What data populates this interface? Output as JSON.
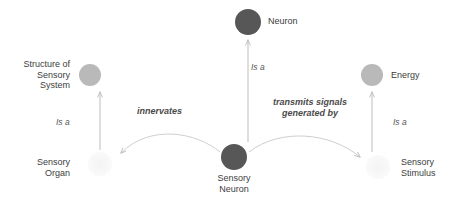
{
  "diagram": {
    "background_color": "#ffffff",
    "colors": {
      "node_dark": "#575757",
      "node_light": "#b9b9b9",
      "node_faint": "#f4f4f4",
      "edge_line": "#bdbdbd",
      "label_text": "#3d3d3d",
      "edge_label_text": "#4a4a4a"
    },
    "nodes": [
      {
        "id": "neuron",
        "label": "Neuron",
        "shade": "dark",
        "cx": 248,
        "cy": 22,
        "r": 13,
        "label_x": 268,
        "label_y": 16,
        "label_align": "left"
      },
      {
        "id": "structure-of-sensory-system",
        "label": "Structure of\nSensory\nSystem",
        "shade": "light",
        "cx": 90,
        "cy": 75,
        "r": 11,
        "label_x": 8,
        "label_y": 60,
        "label_align": "right"
      },
      {
        "id": "energy",
        "label": "Energy",
        "shade": "light",
        "cx": 372,
        "cy": 75,
        "r": 11,
        "label_x": 390,
        "label_y": 70,
        "label_align": "left"
      },
      {
        "id": "sensory-organ",
        "label": "Sensory\nOrgan",
        "shade": "faint",
        "cx": 100,
        "cy": 164,
        "r": 12,
        "label_x": 22,
        "label_y": 158,
        "label_align": "right"
      },
      {
        "id": "sensory-neuron",
        "label": "Sensory\nNeuron",
        "shade": "dark",
        "cx": 234,
        "cy": 157,
        "r": 13,
        "label_x": 206,
        "label_y": 174,
        "label_align": "center"
      },
      {
        "id": "sensory-stimulus",
        "label": "Sensory\nStimulus",
        "shade": "faint",
        "cx": 378,
        "cy": 167,
        "r": 12,
        "label_x": 400,
        "label_y": 158,
        "label_align": "left"
      }
    ],
    "edges": [
      {
        "id": "sensory-neuron-is-a-neuron",
        "from": "sensory-neuron",
        "to": "neuron",
        "label": "Is a",
        "kind": "straight",
        "label_x": 251,
        "label_y": 62
      },
      {
        "id": "sensory-organ-is-a-structure",
        "from": "sensory-organ",
        "to": "structure-of-sensory-system",
        "label": "Is a",
        "kind": "straight",
        "label_x": 55,
        "label_y": 116
      },
      {
        "id": "sensory-stimulus-is-a-energy",
        "from": "sensory-stimulus",
        "to": "energy",
        "label": "Is a",
        "kind": "straight",
        "label_x": 393,
        "label_y": 116
      },
      {
        "id": "sensory-neuron-innervates-sensory-organ",
        "from": "sensory-neuron",
        "to": "sensory-organ",
        "label": "innervates",
        "kind": "curved",
        "label_x": 138,
        "label_y": 106
      },
      {
        "id": "sensory-neuron-transmits-signals-generated-by-sensory-stimulus",
        "from": "sensory-neuron",
        "to": "sensory-stimulus",
        "label": "transmits signals\ngenerated by",
        "kind": "curved",
        "label_x": 256,
        "label_y": 98
      }
    ]
  }
}
